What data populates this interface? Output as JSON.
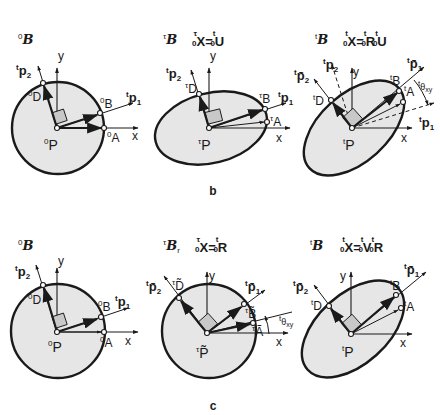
{
  "figure": {
    "subfigure_labels": {
      "b": "b",
      "c": "c"
    },
    "rows": [
      {
        "id": "b",
        "panels": [
          {
            "id": "b1",
            "config_symbol": {
              "sup": "0",
              "base": "B"
            },
            "formula": "",
            "center": {
              "sup": "0",
              "base": "P"
            },
            "points": {
              "A": {
                "sup": "0",
                "base": "A"
              },
              "B": {
                "sup": "0",
                "base": "B"
              },
              "D": {
                "sup": "0",
                "base": "D"
              }
            },
            "vectors": {
              "p1": {
                "sup": "t",
                "base": "p",
                "sub": "1"
              },
              "p2": {
                "sup": "t",
                "base": "p",
                "sub": "2"
              }
            },
            "axes": {
              "x": "x",
              "y": "y"
            }
          },
          {
            "id": "b2",
            "config_symbol": {
              "sup": "τ",
              "base": "B"
            },
            "formula": {
              "lhs_sup": "τ",
              "lhs_sub": "0",
              "lhs": "X",
              "eq": "=",
              "rhs": [
                {
                  "sup": "t",
                  "sub": "0",
                  "base": "U"
                }
              ]
            },
            "center": {
              "sup": "τ",
              "base": "P"
            },
            "points": {
              "A": {
                "sup": "τ",
                "base": "A"
              },
              "B": {
                "sup": "τ",
                "base": "B"
              },
              "D": {
                "sup": "τ",
                "base": "D"
              }
            },
            "vectors": {
              "p1": {
                "sup": "t",
                "base": "p",
                "sub": "1"
              },
              "p2": {
                "sup": "t",
                "base": "p",
                "sub": "2"
              }
            },
            "axes": {
              "x": "x",
              "y": "y"
            }
          },
          {
            "id": "b3",
            "config_symbol": {
              "sup": "t",
              "base": "B"
            },
            "formula": {
              "lhs_sup": "t",
              "lhs_sub": "0",
              "lhs": "X",
              "eq": "=",
              "rhs": [
                {
                  "sup": "t",
                  "sub": "0",
                  "base": "R"
                },
                {
                  "sup": "t",
                  "sub": "0",
                  "base": "U"
                }
              ]
            },
            "center": {
              "sup": "t",
              "base": "P"
            },
            "points": {
              "A": {
                "sup": "t",
                "base": "A"
              },
              "B": {
                "sup": "t",
                "base": "B"
              },
              "D": {
                "sup": "t",
                "base": "D"
              }
            },
            "vectors": {
              "p1": {
                "sup": "t",
                "base": "p",
                "sub": "1"
              },
              "p2": {
                "sup": "t",
                "base": "p",
                "sub": "2"
              },
              "p1bar": {
                "sup": "t",
                "base": "p̄",
                "sub": "1"
              },
              "p2bar": {
                "sup": "t",
                "base": "p̄",
                "sub": "2"
              }
            },
            "angle": {
              "sup": "t",
              "base": "θ",
              "sub": "xy"
            },
            "axes": {
              "x": "x",
              "y": "y"
            }
          }
        ]
      },
      {
        "id": "c",
        "panels": [
          {
            "id": "c1",
            "config_symbol": {
              "sup": "0",
              "base": "B"
            },
            "formula": "",
            "center": {
              "sup": "0",
              "base": "P"
            },
            "points": {
              "A": {
                "sup": "0",
                "base": "A"
              },
              "B": {
                "sup": "0",
                "base": "B"
              },
              "D": {
                "sup": "0",
                "base": "D"
              }
            },
            "vectors": {
              "p1": {
                "sup": "t",
                "base": "p",
                "sub": "1"
              },
              "p2": {
                "sup": "t",
                "base": "p",
                "sub": "2"
              }
            },
            "axes": {
              "x": "x",
              "y": "y"
            }
          },
          {
            "id": "c2",
            "config_symbol": {
              "sup": "τ",
              "base": "B",
              "sub": "r"
            },
            "formula": {
              "lhs_sup": "τ",
              "lhs_sub": "0",
              "lhs": "X",
              "eq": "=",
              "rhs": [
                {
                  "sup": "t",
                  "sub": "0",
                  "base": "R"
                }
              ]
            },
            "center": {
              "sup": "τ",
              "base": "P̃"
            },
            "points": {
              "A": {
                "sup": "τ",
                "base": "Ã"
              },
              "B": {
                "sup": "τ",
                "base": "B̃"
              },
              "D": {
                "sup": "τ",
                "base": "D̃"
              }
            },
            "vectors": {
              "p1bar": {
                "sup": "t",
                "base": "p̄",
                "sub": "1"
              },
              "p2bar": {
                "sup": "t",
                "base": "p̄",
                "sub": "2"
              }
            },
            "angle": {
              "sup": "t",
              "base": "θ",
              "sub": "xy"
            },
            "axes": {
              "x": "x",
              "y": "y"
            }
          },
          {
            "id": "c3",
            "config_symbol": {
              "sup": "t",
              "base": "B"
            },
            "formula": {
              "lhs_sup": "t",
              "lhs_sub": "0",
              "lhs": "X",
              "eq": "=",
              "rhs": [
                {
                  "sup": "t",
                  "sub": "0",
                  "base": "V"
                },
                {
                  "sup": "t",
                  "sub": "0",
                  "base": "R"
                }
              ]
            },
            "center": {
              "sup": "t",
              "base": "P"
            },
            "points": {
              "A": {
                "sup": "t",
                "base": "A"
              },
              "B": {
                "sup": "t",
                "base": "B"
              },
              "D": {
                "sup": "t",
                "base": "D"
              }
            },
            "vectors": {
              "p1bar": {
                "sup": "t",
                "base": "p̄",
                "sub": "1"
              },
              "p2bar": {
                "sup": "t",
                "base": "p̄",
                "sub": "2"
              }
            },
            "axes": {
              "x": "x",
              "y": "y"
            }
          }
        ]
      }
    ]
  }
}
